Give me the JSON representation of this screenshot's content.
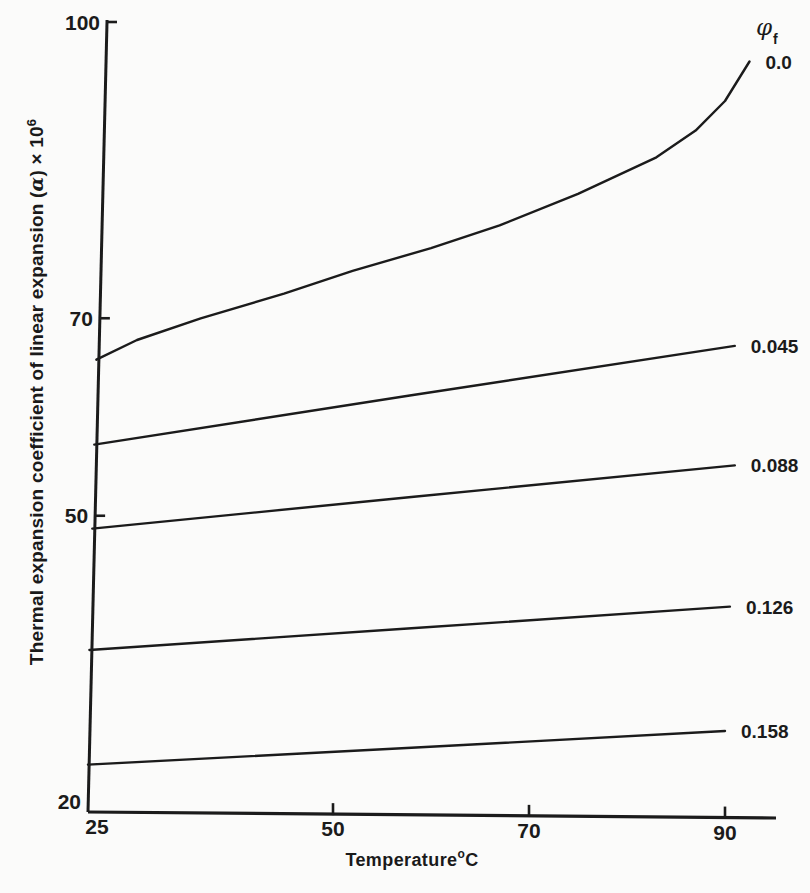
{
  "figure": {
    "xlabel_parts": {
      "pre": "Temperature",
      "sup": "o",
      "post": "C"
    },
    "ylabel_parts": {
      "pre": "Thermal expansion coefficient of linear expansion (",
      "alpha": "α",
      "post": ") × 10",
      "sup": "6"
    },
    "legend_parts": {
      "phi": "φ",
      "sub": "f"
    }
  },
  "chart_data": {
    "type": "line",
    "title": "",
    "xlabel": "Temperature °C",
    "ylabel": "Thermal expansion coefficient of linear expansion (α) × 10⁶",
    "legend_title": "φf",
    "legend_position": "right-end-of-lines",
    "grid": false,
    "x_ticks": [
      25,
      50,
      70,
      90
    ],
    "y_ticks": [
      20,
      50,
      70,
      100
    ],
    "xlim": [
      25,
      95
    ],
    "ylim": [
      20,
      100
    ],
    "ink_color": "#1b1b1b",
    "background": "#fbfbfa",
    "series": [
      {
        "name": "phi-0.0",
        "label": "0.0",
        "points": [
          [
            25,
            65.8
          ],
          [
            30,
            67.8
          ],
          [
            36.5,
            70
          ],
          [
            45,
            72.5
          ],
          [
            52,
            74.8
          ],
          [
            60,
            77.1
          ],
          [
            67,
            79.4
          ],
          [
            75,
            82.6
          ],
          [
            83,
            86.3
          ],
          [
            87,
            89.0
          ],
          [
            90,
            92.0
          ],
          [
            92.5,
            96.0
          ]
        ]
      },
      {
        "name": "phi-0.045",
        "label": "0.045",
        "points": [
          [
            25,
            57.2
          ],
          [
            58,
            62.2
          ],
          [
            91,
            67.2
          ]
        ]
      },
      {
        "name": "phi-0.088",
        "label": "0.088",
        "points": [
          [
            25,
            48.7
          ],
          [
            58,
            51.9
          ],
          [
            91,
            55.1
          ]
        ]
      },
      {
        "name": "phi-0.126",
        "label": "0.126",
        "points": [
          [
            25,
            36.4
          ],
          [
            58,
            38.6
          ],
          [
            90.5,
            40.8
          ]
        ]
      },
      {
        "name": "phi-0.158",
        "label": "0.158",
        "points": [
          [
            25,
            24.8
          ],
          [
            58,
            26.5
          ],
          [
            90,
            28.2
          ]
        ]
      }
    ]
  }
}
